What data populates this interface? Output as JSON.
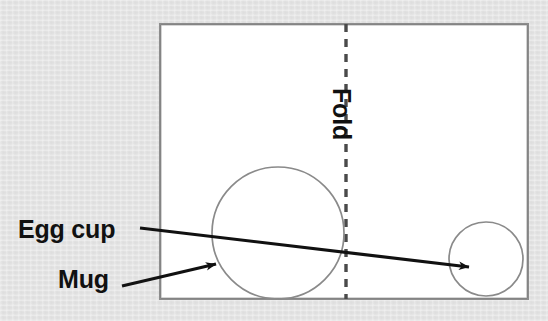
{
  "figure": {
    "type": "line-diagram",
    "background_color": "#e4e4e4",
    "sheet_color": "#ffffff",
    "ink_color": "#111111",
    "outline_color": "#8c8c8c",
    "labels": {
      "egg_cup": "Egg cup",
      "mug": "Mug",
      "fold": "Fold"
    },
    "sheet": {
      "name": "paper-sheet",
      "x": 160,
      "y": 24,
      "width": 368,
      "height": 275
    },
    "fold_line": {
      "name": "fold-line",
      "x": 346,
      "y_top": 24,
      "y_bottom": 299,
      "style": "dashed"
    },
    "objects": [
      {
        "name": "mug-circle",
        "label": "Mug",
        "cx": 278,
        "cy": 233,
        "r": 66
      },
      {
        "name": "egg-cup-circle",
        "label": "Egg cup",
        "cx": 486,
        "cy": 259,
        "r": 37
      }
    ],
    "annotations": [
      {
        "name": "egg-cup-leader",
        "label": "Egg cup",
        "from_x": 140,
        "from_y": 228,
        "to_x": 469,
        "to_y": 267
      },
      {
        "name": "mug-leader",
        "label": "Mug",
        "from_x": 122,
        "from_y": 285,
        "to_x": 217,
        "to_y": 264
      }
    ],
    "label_positions": {
      "egg_cup": {
        "x": 18,
        "y": 238
      },
      "mug": {
        "x": 58,
        "y": 288
      },
      "fold": {
        "x": 333,
        "y": 88,
        "rotation": 90
      }
    }
  }
}
